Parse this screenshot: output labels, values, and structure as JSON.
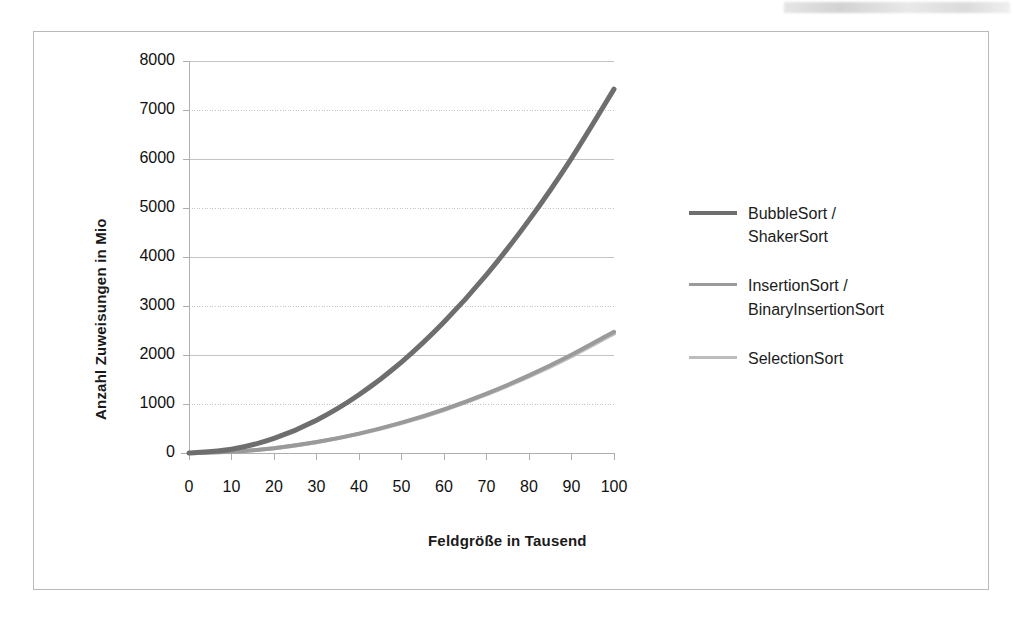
{
  "chart_data": {
    "type": "line",
    "title": "",
    "xlabel": "Feldgröße in Tausend",
    "ylabel": "Anzahl Zuweisungen in Mio",
    "xlim": [
      0,
      100
    ],
    "ylim": [
      0,
      8000
    ],
    "grid": true,
    "legend_position": "right",
    "x_ticks": [
      "0",
      "10",
      "20",
      "30",
      "40",
      "50",
      "60",
      "70",
      "80",
      "90",
      "100"
    ],
    "y_ticks": [
      "0",
      "1000",
      "2000",
      "3000",
      "4000",
      "5000",
      "6000",
      "7000",
      "8000"
    ],
    "x": [
      0,
      10,
      20,
      30,
      40,
      50,
      60,
      70,
      80,
      90,
      100
    ],
    "series": [
      {
        "name": "BubbleSort /\nShakerSort",
        "color": "#6e6e6e",
        "width": 5,
        "values": [
          0,
          75,
          297,
          668,
          1188,
          1856,
          2673,
          3638,
          4752,
          6015,
          7426
        ]
      },
      {
        "name": "InsertionSort /\nBinaryInsertionSort",
        "color": "#9a9a9a",
        "width": 4,
        "values": [
          0,
          25,
          99,
          223,
          396,
          619,
          891,
          1213,
          1584,
          2005,
          2475
        ]
      },
      {
        "name": "SelectionSort",
        "color": "#bdbdbd",
        "width": 4,
        "values": [
          0,
          24,
          97,
          219,
          390,
          609,
          878,
          1195,
          1561,
          1976,
          2440
        ]
      }
    ]
  },
  "axes": {
    "y_title": "Anzahl Zuweisungen in Mio",
    "x_title": "Feldgröße in Tausend"
  },
  "legend": {
    "items": [
      {
        "label": "BubbleSort /\nShakerSort",
        "color": "#6e6e6e"
      },
      {
        "label": "InsertionSort /\nBinaryInsertionSort",
        "color": "#9a9a9a"
      },
      {
        "label": "SelectionSort",
        "color": "#bdbdbd"
      }
    ]
  }
}
